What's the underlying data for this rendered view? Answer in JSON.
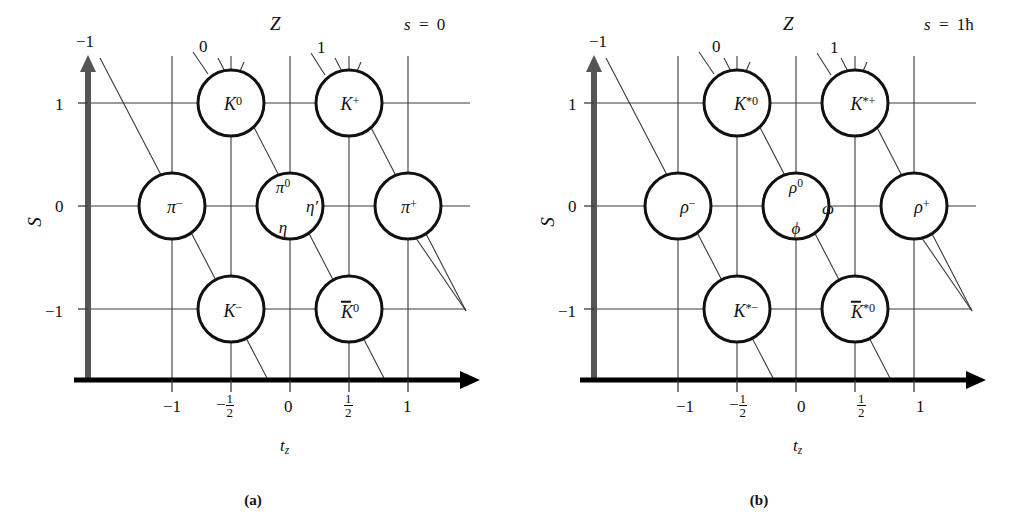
{
  "figure": {
    "caption_a": "(a)",
    "caption_b": "(b)"
  },
  "chart_data": {
    "type": "scatter",
    "xlabel": "t_z",
    "ylabel": "S",
    "diagonal_axis_label": "Z",
    "xlim": [
      -1.5,
      1.5
    ],
    "ylim": [
      -1.5,
      1.5
    ],
    "grid": true,
    "x_ticks": [
      -1,
      -0.5,
      0,
      0.5,
      1
    ],
    "x_tick_labels": [
      "−1",
      "−½",
      "0",
      "½",
      "1"
    ],
    "y_ticks": [
      -1,
      0,
      1
    ],
    "y_tick_labels": [
      "−1",
      "0",
      "1"
    ],
    "z_ticks": [
      -1,
      0,
      1
    ],
    "z_tick_labels": [
      "−1",
      "0",
      "1"
    ],
    "panels": [
      {
        "id": "a",
        "spin_label": "s = 0",
        "points": [
          {
            "tz": -0.5,
            "S": 1,
            "label": "K0"
          },
          {
            "tz": 0.5,
            "S": 1,
            "label": "K+"
          },
          {
            "tz": -1,
            "S": 0,
            "label": "pi-"
          },
          {
            "tz": 0,
            "S": 0,
            "label": "pi0 eta etaprime"
          },
          {
            "tz": 1,
            "S": 0,
            "label": "pi+"
          },
          {
            "tz": -0.5,
            "S": -1,
            "label": "K-"
          },
          {
            "tz": 0.5,
            "S": -1,
            "label": "Kbar0"
          }
        ]
      },
      {
        "id": "b",
        "spin_label": "s = 1ħ",
        "points": [
          {
            "tz": -0.5,
            "S": 1,
            "label": "K*0"
          },
          {
            "tz": 0.5,
            "S": 1,
            "label": "K*+"
          },
          {
            "tz": -1,
            "S": 0,
            "label": "rho-"
          },
          {
            "tz": 0,
            "S": 0,
            "label": "rho0 phi omega"
          },
          {
            "tz": 1,
            "S": 0,
            "label": "rho+"
          },
          {
            "tz": -0.5,
            "S": -1,
            "label": "K*-"
          },
          {
            "tz": 0.5,
            "S": -1,
            "label": "Kbar*0"
          }
        ]
      }
    ]
  },
  "panel_a": {
    "spin_label_s": "s",
    "spin_label_eq": "=",
    "spin_label_val": "0",
    "z_axis_label": "Z",
    "y_axis_label": "S",
    "x_axis_label_t": "t",
    "x_axis_label_z": "z",
    "x_ticks": [
      "−1",
      "−1",
      "0",
      "1",
      "1"
    ],
    "x_tick_0": "−1",
    "x_tick_1_num": "1",
    "x_tick_1_den": "2",
    "x_tick_1_sign": "−",
    "x_tick_2": "0",
    "x_tick_3_num": "1",
    "x_tick_3_den": "2",
    "x_tick_4": "1",
    "y_tick_top": "1",
    "y_tick_mid": "0",
    "y_tick_bot": "−1",
    "z_tick_left": "−1",
    "z_tick_mid": "0",
    "z_tick_right": "1",
    "particles": {
      "K0_sym": "K",
      "K0_sup": "0",
      "Kp_sym": "K",
      "Kp_sup": "+",
      "pim_sym": "π",
      "pim_sup": "−",
      "pi0_sym": "π",
      "pi0_sup": "0",
      "eta_sym": "η",
      "etap_sym": "η′",
      "pip_sym": "π",
      "pip_sup": "+",
      "Km_sym": "K",
      "Km_sup": "−",
      "Kbar0_sym": "K",
      "Kbar0_sup": "0"
    }
  },
  "panel_b": {
    "spin_label_s": "s",
    "spin_label_eq": "=",
    "spin_label_val": "1ħ",
    "z_axis_label": "Z",
    "y_axis_label": "S",
    "x_axis_label_t": "t",
    "x_axis_label_z": "z",
    "x_tick_0": "−1",
    "x_tick_1_num": "1",
    "x_tick_1_den": "2",
    "x_tick_1_sign": "−",
    "x_tick_2": "0",
    "x_tick_3_num": "1",
    "x_tick_3_den": "2",
    "x_tick_4": "1",
    "y_tick_top": "1",
    "y_tick_mid": "0",
    "y_tick_bot": "−1",
    "z_tick_left": "−1",
    "z_tick_mid": "0",
    "z_tick_right": "1",
    "particles": {
      "Ks0_sym": "K",
      "Ks0_sup": "*0",
      "Ksp_sym": "K",
      "Ksp_sup": "*+",
      "rhom_sym": "ρ",
      "rhom_sup": "−",
      "rho0_sym": "ρ",
      "rho0_sup": "0",
      "phi_sym": "ϕ",
      "omega_sym": "ω",
      "rhop_sym": "ρ",
      "rhop_sup": "+",
      "Ksm_sym": "K",
      "Ksm_sup": "*−",
      "Kbars0_sym": "K",
      "Kbars0_sup": "*0"
    }
  },
  "colors": {
    "ink": "#111111",
    "grid": "#3a3a3a",
    "axis": "#000000",
    "s_axis_arrow": "#555555",
    "background": "#ffffff"
  }
}
